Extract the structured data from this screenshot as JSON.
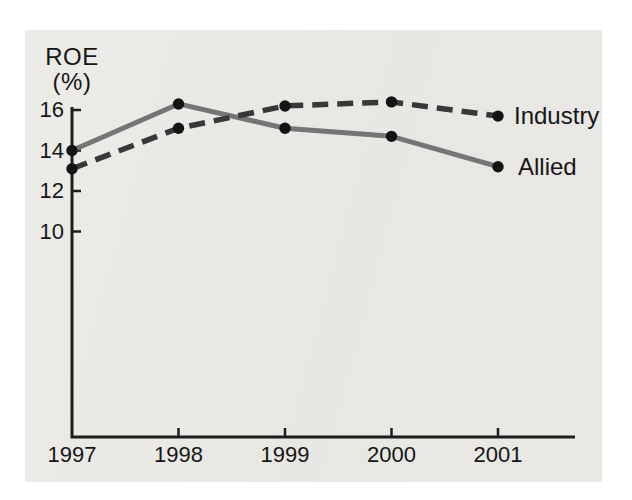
{
  "figure": {
    "background_color": "#ffffff",
    "panel_color": "#e9e7e3"
  },
  "chart_data": {
    "type": "line",
    "title": "",
    "ylabel_line1": "ROE",
    "ylabel_line2": "(%)",
    "xlabel": "",
    "x": [
      "1997",
      "1998",
      "1999",
      "2000",
      "2001"
    ],
    "y_ticks": [
      "16",
      "14",
      "12",
      "10"
    ],
    "y_axis_range_drawn": [
      9.5,
      16.6
    ],
    "grid": false,
    "axis_color": "#1d1d1d",
    "marker_color": "#141414",
    "legend_position": "end-of-line-labels",
    "series": [
      {
        "name": "Industry",
        "style": "dashed",
        "color": "#383838",
        "values": [
          13.1,
          15.1,
          16.2,
          16.4,
          15.7
        ]
      },
      {
        "name": "Allied",
        "style": "solid",
        "color": "#757575",
        "values": [
          14.0,
          16.3,
          15.1,
          14.7,
          13.2
        ]
      }
    ]
  }
}
